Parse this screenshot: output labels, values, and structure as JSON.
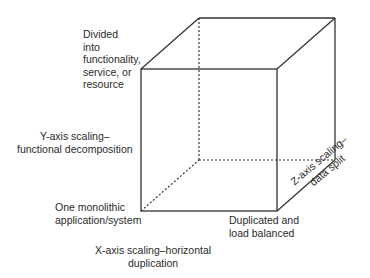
{
  "diagram": {
    "type": "scale-cube",
    "labels": {
      "divided": [
        "Divided",
        "into",
        "functionality,",
        "service, or",
        "resource"
      ],
      "y_axis": [
        "Y-axis scaling–",
        "functional decomposition"
      ],
      "monolithic": [
        "One monolithic",
        "application/system"
      ],
      "duplicated": [
        "Duplicated and",
        "load balanced"
      ],
      "x_axis": [
        "X-axis scaling–horizontal",
        "duplication"
      ],
      "z_axis": [
        "Z-axis scaling–",
        "data split"
      ]
    },
    "colors": {
      "line": "#333333",
      "text": "#2a2a2a",
      "background": "#ffffff"
    }
  }
}
